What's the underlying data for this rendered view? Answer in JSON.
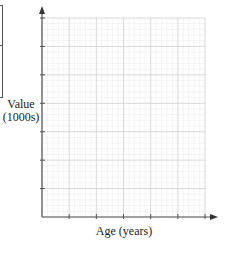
{
  "chart_data": {
    "type": "line",
    "title": "",
    "xlabel": "Age (years)",
    "ylabel_line1": "Value",
    "ylabel_line2": "(1000s)",
    "x_major_divisions": 6,
    "y_major_divisions": 7,
    "minor_per_major": 5,
    "grid": true,
    "series": [],
    "tick_labels_x": [],
    "tick_labels_y": [],
    "legend": null
  },
  "colors": {
    "axis": "#555555",
    "major_grid": "#cfcfcf",
    "minor_grid": "#ececec"
  }
}
